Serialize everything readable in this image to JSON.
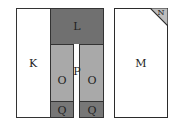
{
  "diagram": {
    "colors": {
      "L": "#707070",
      "O": "#a9a9a9",
      "Q": "#777777",
      "N": "#bdbdbd",
      "border": "#2b2b2b",
      "background": "#ffffff"
    },
    "blocks": {
      "K": {
        "label": "K"
      },
      "L": {
        "label": "L"
      },
      "M": {
        "label": "M"
      },
      "N": {
        "label": "N"
      },
      "O_left": {
        "label": "O"
      },
      "O_right": {
        "label": "O"
      },
      "P": {
        "label": "P"
      },
      "Q_left": {
        "label": "Q"
      },
      "Q_right": {
        "label": "Q"
      }
    }
  }
}
